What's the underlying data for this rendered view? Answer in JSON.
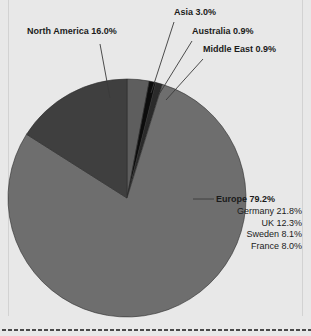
{
  "panel": {
    "background_color": "#e8e8e8",
    "rule_color": "#d2d2d2",
    "dotted_border_color": "#4a4a4a"
  },
  "labels": {
    "north_america": "North America 16.0%",
    "asia": "Asia 3.0%",
    "australia": "Australia 0.9%",
    "middle_east": "Middle East 0.9%",
    "europe": "Europe 79.2%",
    "germany": "Germany 21.8%",
    "uk": "UK 12.3%",
    "sweden": "Sweden 8.1%",
    "france": "France 8.0%"
  },
  "chart_data": {
    "type": "pie",
    "title": "",
    "xlabel": "",
    "ylabel": "",
    "legend": "none",
    "grid": false,
    "units": "percent",
    "start_angle_deg": 0,
    "direction": "clockwise",
    "center": {
      "x": 127,
      "y": 198
    },
    "radius": 119,
    "categories": [
      "Asia",
      "Australia",
      "Middle East",
      "Europe",
      "North America"
    ],
    "values": [
      3.0,
      0.9,
      0.9,
      79.2,
      16.0
    ],
    "colors": [
      "#5e5e5e",
      "#0c0c0c",
      "#2a2a2a",
      "#6e6e6e",
      "#3f3f3f"
    ],
    "slices": [
      {
        "name": "Asia",
        "value": 3.0,
        "label": "Asia 3.0%",
        "color": "#5e5e5e",
        "start_deg": 0.0,
        "end_deg": 10.8,
        "leader": true
      },
      {
        "name": "Australia",
        "value": 0.9,
        "label": "Australia 0.9%",
        "color": "#0c0c0c",
        "start_deg": 10.8,
        "end_deg": 14.04,
        "leader": true
      },
      {
        "name": "Middle East",
        "value": 0.9,
        "label": "Middle East 0.9%",
        "color": "#2a2a2a",
        "start_deg": 14.04,
        "end_deg": 17.28,
        "leader": true
      },
      {
        "name": "Europe",
        "value": 79.2,
        "label": "Europe 79.2%",
        "color": "#6e6e6e",
        "start_deg": 17.28,
        "end_deg": 302.4,
        "leader": true
      },
      {
        "name": "North America",
        "value": 16.0,
        "label": "North America 16.0%",
        "color": "#3f3f3f",
        "start_deg": 302.4,
        "end_deg": 360.0,
        "leader": true
      }
    ],
    "breakdown": {
      "parent": "Europe",
      "items": [
        {
          "name": "Germany",
          "value": 21.8,
          "label": "Germany 21.8%"
        },
        {
          "name": "UK",
          "value": 12.3,
          "label": "UK 12.3%"
        },
        {
          "name": "Sweden",
          "value": 8.1,
          "label": "Sweden 8.1%"
        },
        {
          "name": "France",
          "value": 8.0,
          "label": "France 8.0%"
        }
      ]
    }
  }
}
